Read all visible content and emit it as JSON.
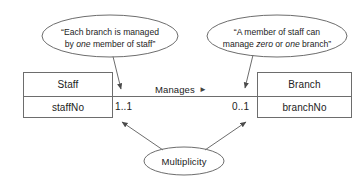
{
  "diagram": {
    "type": "uml-class-relationship",
    "entities": [
      {
        "name": "Staff",
        "attribute": "staffNo",
        "multiplicity": "1..1"
      },
      {
        "name": "Branch",
        "attribute": "branchNo",
        "multiplicity": "0..1"
      }
    ],
    "relationship": {
      "label": "Manages",
      "direction_marker": "►"
    },
    "callouts": [
      {
        "id": "left-callout",
        "line1_pre": "“Each branch is managed",
        "line2_pre": "by ",
        "line2_em": "one",
        "line2_post": " member of staff”"
      },
      {
        "id": "right-callout",
        "line1_pre": "“A member of staff can",
        "line2_pre": "manage ",
        "line2_em1": "zero",
        "line2_mid": " or ",
        "line2_em2": "one",
        "line2_post": " branch”"
      }
    ],
    "annotation_ellipse": {
      "label": "Multiplicity"
    },
    "colors": {
      "stroke": "#6d6d6d",
      "text": "#222222",
      "background": "#ffffff"
    }
  }
}
